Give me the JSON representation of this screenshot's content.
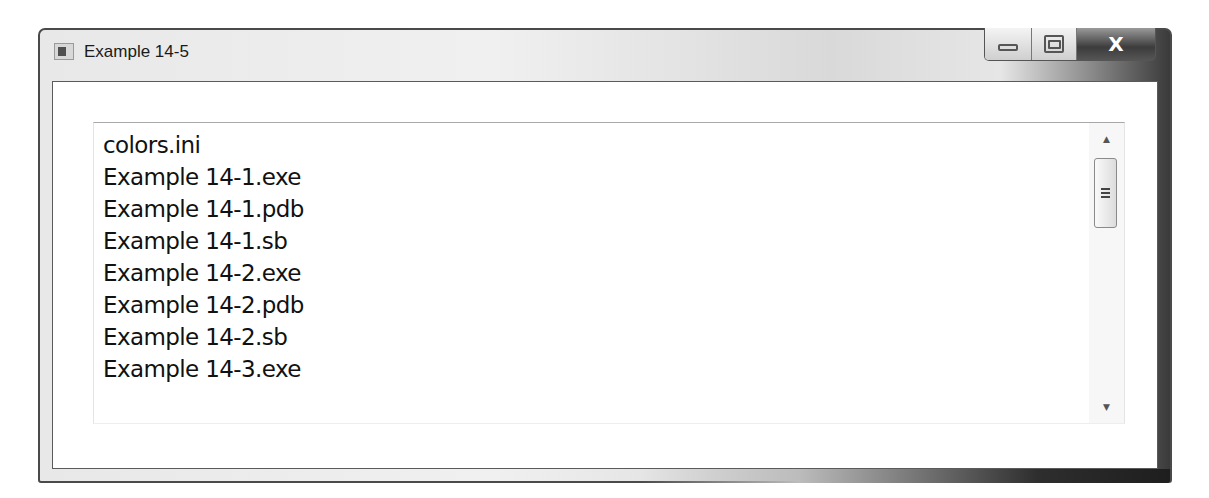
{
  "window": {
    "title": "Example 14-5",
    "icon": "application-icon",
    "controls": {
      "minimize": "minimize-icon",
      "maximize": "maximize-icon",
      "close_label": "X"
    }
  },
  "listbox": {
    "items": [
      "colors.ini",
      "Example 14-1.exe",
      "Example 14-1.pdb",
      "Example 14-1.sb",
      "Example 14-2.exe",
      "Example 14-2.pdb",
      "Example 14-2.sb",
      "Example 14-3.exe"
    ],
    "scrollbar": {
      "up_arrow": "▲",
      "down_arrow": "▼"
    }
  }
}
